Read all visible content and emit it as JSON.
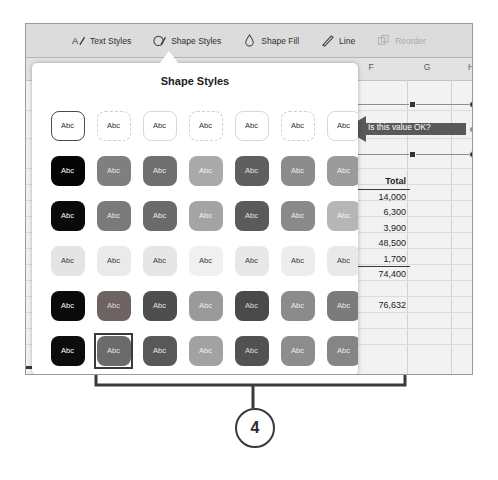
{
  "toolbar": {
    "items": [
      {
        "label": "Text Styles",
        "icon": "text-styles-icon",
        "disabled": false
      },
      {
        "label": "Shape Styles",
        "icon": "shape-styles-icon",
        "disabled": false
      },
      {
        "label": "Shape Fill",
        "icon": "shape-fill-icon",
        "disabled": false
      },
      {
        "label": "Line",
        "icon": "line-icon",
        "disabled": false
      },
      {
        "label": "Reorder",
        "icon": "reorder-icon",
        "disabled": true
      }
    ]
  },
  "popover": {
    "title": "Shape Styles",
    "swatch_label": "Abc",
    "selected_row": 0,
    "selected_col": 0,
    "picked_row": 5,
    "picked_col": 1,
    "rows": [
      {
        "style": "outline",
        "colors": [
          "#ffffff",
          "#ffffff",
          "#ffffff",
          "#ffffff",
          "#ffffff",
          "#ffffff",
          "#ffffff"
        ],
        "text_colors": [
          "#2b2b2b",
          "#2b2b2b",
          "#2b2b2b",
          "#2b2b2b",
          "#2b2b2b",
          "#2b2b2b",
          "#2b2b2b"
        ]
      },
      {
        "style": "fill",
        "colors": [
          "#050505",
          "#7f7f7f",
          "#6f6f6f",
          "#a9a9a9",
          "#5f5f5f",
          "#8c8c8c",
          "#9b9b9b"
        ],
        "text_colors": [
          "#ffffff",
          "#e8e8e8",
          "#ededed",
          "#f2f2f2",
          "#e2e2e2",
          "#efefef",
          "#f0f0f0"
        ]
      },
      {
        "style": "fill",
        "colors": [
          "#0a0a0a",
          "#7a7a7a",
          "#6a6a6a",
          "#a4a4a4",
          "#5a5a5a",
          "#8a8a8a",
          "#b6b6b6"
        ],
        "text_colors": [
          "#ffffff",
          "#ebebeb",
          "#efefef",
          "#f4f4f4",
          "#e4e4e4",
          "#f0f0f0",
          "#f6f6f6"
        ]
      },
      {
        "style": "fill",
        "colors": [
          "#e4e4e4",
          "#eaeaea",
          "#e6e6e6",
          "#f0f0f0",
          "#e8e8e8",
          "#ededed",
          "#e9e9e9"
        ],
        "text_colors": [
          "#3a3a3a",
          "#3a3a3a",
          "#3a3a3a",
          "#3a3a3a",
          "#3a3a3a",
          "#3a3a3a",
          "#3a3a3a"
        ]
      },
      {
        "style": "fill",
        "colors": [
          "#0a0a0a",
          "#6e6363",
          "#4e4e4e",
          "#9a9a9a",
          "#4a4a4a",
          "#8b8b8b",
          "#7b7b7b"
        ],
        "text_colors": [
          "#ffffff",
          "#e0dada",
          "#e6e6e6",
          "#efefef",
          "#dcdcdc",
          "#eeeeee",
          "#ebebeb"
        ]
      },
      {
        "style": "fill",
        "colors": [
          "#0c0c0c",
          "#6b6b6b",
          "#585858",
          "#a2a2a2",
          "#525252",
          "#8d8d8d",
          "#858585"
        ],
        "text_colors": [
          "#ffffff",
          "#e6e6e6",
          "#e8e8e8",
          "#f1f1f1",
          "#dedede",
          "#efefef",
          "#ececec"
        ]
      }
    ]
  },
  "spreadsheet": {
    "column_headers": [
      "F",
      "G",
      "H"
    ],
    "total_column": {
      "header": "Total",
      "values": [
        "14,000",
        "6,300",
        "3,900",
        "48,500",
        "1,700",
        "74,400",
        "",
        "76,632"
      ]
    }
  },
  "comment": {
    "text": "Is this value OK?",
    "shape": "left-arrow",
    "fill": "#595959"
  },
  "annotation": {
    "callout_number": "4",
    "line_color": "#3a3a3a"
  }
}
